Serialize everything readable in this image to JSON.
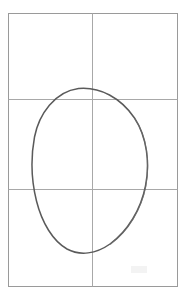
{
  "figure": {
    "title": "Tilted ellipse inscribed in a grid rectangle",
    "background_color": "#ffffff",
    "canvas": {
      "width": 188,
      "height": 299
    }
  },
  "chart_data": {
    "type": "scatter",
    "title": "Tilted ellipse inscribed in a grid rectangle",
    "subtitle": "",
    "xlabel": "",
    "ylabel": "",
    "xlim": [
      8,
      178
    ],
    "ylim": [
      13,
      287
    ],
    "grid": true,
    "legend_position": "none",
    "annotations": [],
    "tick_labels": {
      "x": [],
      "y": []
    },
    "series": [
      {
        "name": "ellipse-outline",
        "shape": "ellipse",
        "center": [
          90,
          170
        ],
        "radius_major": 84,
        "radius_minor": 58,
        "rotation_deg": -70,
        "stroke": "#5a5a5a",
        "stroke_width": 1.5,
        "fill": "none",
        "extreme_points": {
          "top": [
            78,
            88
          ],
          "left": [
            33,
            157
          ],
          "right": [
            146,
            186
          ],
          "bottom": [
            92,
            252
          ]
        }
      }
    ]
  },
  "frame": {
    "label": "outer-rectangle",
    "x": 8,
    "y": 13,
    "width": 170,
    "height": 274,
    "stroke": "#9a9a9a",
    "stroke_width": 1
  },
  "gridlines": {
    "stroke": "#a8a8a8",
    "stroke_width": 1,
    "vertical": [
      {
        "label": "vertical-center-rule",
        "x": 92,
        "y1": 13,
        "y2": 287
      }
    ],
    "horizontal": [
      {
        "label": "upper-horizontal-rule",
        "y": 99,
        "x1": 8,
        "x2": 178
      },
      {
        "label": "lower-horizontal-rule",
        "y": 189,
        "x1": 8,
        "x2": 178
      }
    ]
  },
  "cells": {
    "rows": 3,
    "columns": 2,
    "count": 6
  },
  "colors": {
    "background": "#ffffff",
    "ellipse_stroke": "#5a5a5a",
    "grid_stroke": "#a8a8a8",
    "frame_stroke": "#9a9a9a",
    "smudge": "#efefef"
  },
  "artifacts": [
    {
      "label": "faint-scan-smudge",
      "x": 131,
      "y": 266,
      "width": 16,
      "height": 7,
      "color": "#f2f2f2"
    }
  ]
}
